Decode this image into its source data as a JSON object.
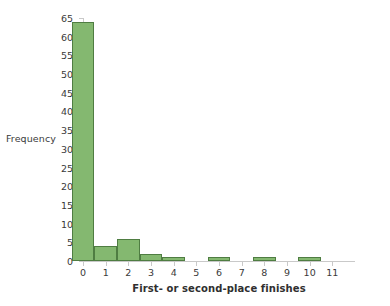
{
  "chart_data": {
    "type": "bar",
    "title": "",
    "subtitle": "",
    "xlabel": "First- or second-place finishes",
    "ylabel": "Frequency",
    "categories": [
      "0",
      "1",
      "2",
      "3",
      "4",
      "5",
      "6",
      "7",
      "8",
      "9",
      "10",
      "11"
    ],
    "values": [
      64,
      4,
      6,
      2,
      1,
      0,
      1,
      0,
      1,
      0,
      1,
      0
    ],
    "xlim": [
      0,
      12
    ],
    "ylim": [
      0,
      65
    ],
    "y_ticks": [
      0,
      5,
      10,
      15,
      20,
      25,
      30,
      35,
      40,
      45,
      50,
      55,
      60,
      65
    ],
    "x_ticks": [
      0,
      1,
      2,
      3,
      4,
      5,
      6,
      7,
      8,
      9,
      10,
      11
    ],
    "grid": false,
    "legend": "none",
    "bar_fill_color": "#84b870",
    "bar_edge_color": "#4f7d42",
    "axis_color": "#c9c9c9",
    "text_color": "#3a3a3a",
    "background_color": "#ffffff",
    "bin_width": 1,
    "annotations": []
  }
}
